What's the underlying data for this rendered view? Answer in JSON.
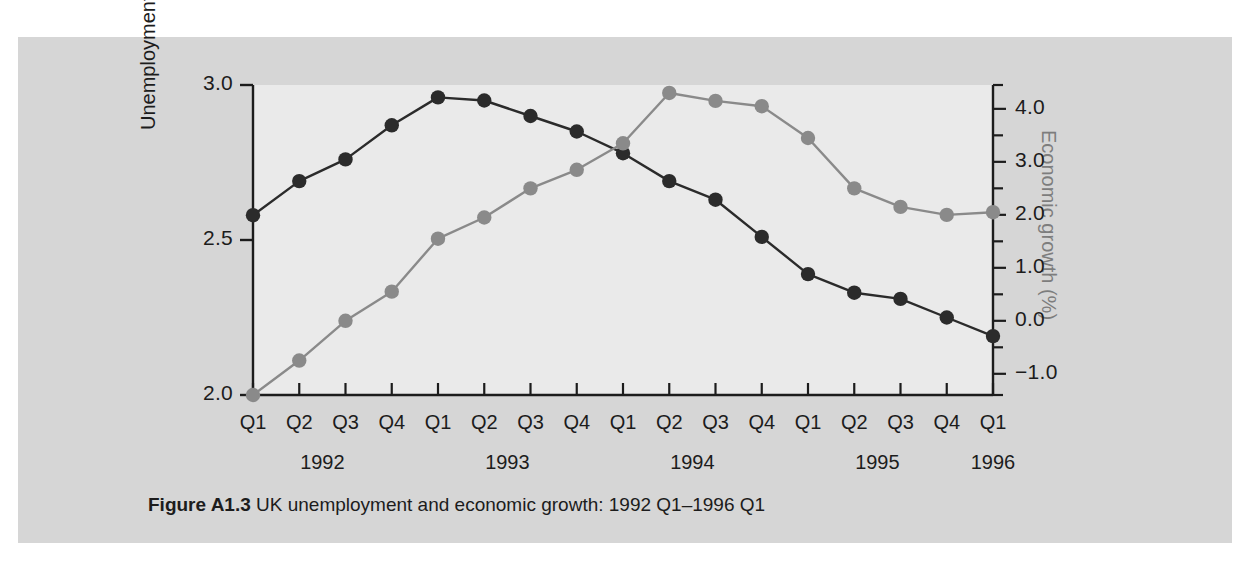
{
  "figure": {
    "caption_label": "Figure A1.3",
    "caption_text": "UK unemployment and economic growth: 1992 Q1–1996 Q1",
    "panel_background": "#eaeaea",
    "box_background": "#d6d6d6",
    "page_background": "#ffffff"
  },
  "chart_data": {
    "type": "line",
    "title": "UK unemployment and economic growth: 1992 Q1–1996 Q1",
    "xlabel": "",
    "ylabel": "Unemployment (millions)",
    "y2label": "Economic growth (%)",
    "grid": false,
    "legend": "none",
    "x": [
      "1992 Q1",
      "1992 Q2",
      "1992 Q3",
      "1992 Q4",
      "1993 Q1",
      "1993 Q2",
      "1993 Q3",
      "1993 Q4",
      "1994 Q1",
      "1994 Q2",
      "1994 Q3",
      "1994 Q4",
      "1995 Q1",
      "1995 Q2",
      "1995 Q3",
      "1995 Q4",
      "1996 Q1"
    ],
    "quarter_ticks": [
      "Q1",
      "Q2",
      "Q3",
      "Q4",
      "Q1",
      "Q2",
      "Q3",
      "Q4",
      "Q1",
      "Q2",
      "Q3",
      "Q4",
      "Q1",
      "Q2",
      "Q3",
      "Q4",
      "Q1"
    ],
    "year_groups": [
      {
        "label": "1992",
        "start_index": 0,
        "end_index": 3
      },
      {
        "label": "1993",
        "start_index": 4,
        "end_index": 7
      },
      {
        "label": "1994",
        "start_index": 8,
        "end_index": 11
      },
      {
        "label": "1995",
        "start_index": 12,
        "end_index": 15
      },
      {
        "label": "1996",
        "start_index": 16,
        "end_index": 16
      }
    ],
    "ylim": [
      2.0,
      3.0
    ],
    "yticks": [
      2.0,
      2.5,
      3.0
    ],
    "ytick_labels": [
      "2.0",
      "2.5",
      "3.0"
    ],
    "y_minor_step": 0.05,
    "y2lim": [
      -1.4,
      4.45
    ],
    "y2ticks": [
      -1.0,
      0.0,
      1.0,
      2.0,
      3.0,
      4.0
    ],
    "y2tick_labels": [
      "−1.0",
      "0.0",
      "1.0",
      "2.0",
      "3.0",
      "4.0"
    ],
    "y2_minor_step": 0.5,
    "series": [
      {
        "name": "Unemployment (millions)",
        "axis": "left",
        "color": "#2b2b2b",
        "marker": "circle",
        "values": [
          2.58,
          2.69,
          2.76,
          2.87,
          2.96,
          2.95,
          2.9,
          2.85,
          2.78,
          2.69,
          2.63,
          2.51,
          2.39,
          2.33,
          2.31,
          2.25,
          2.19
        ]
      },
      {
        "name": "Economic growth (%)",
        "axis": "right",
        "color": "#8a8a8a",
        "marker": "circle",
        "values": [
          -1.4,
          -0.75,
          0.0,
          0.55,
          1.55,
          1.95,
          2.5,
          2.85,
          3.35,
          4.3,
          4.15,
          4.05,
          3.45,
          2.5,
          2.15,
          2.0,
          2.05
        ]
      }
    ]
  },
  "axes": {
    "left_title": "Unemployment (millions)",
    "right_title": "Economic growth (%)"
  }
}
